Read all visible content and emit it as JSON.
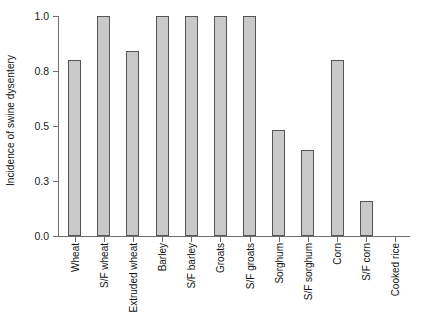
{
  "chart_data": {
    "type": "bar",
    "title": "",
    "xlabel": "",
    "ylabel": "Incidence of swine dysentery",
    "categories": [
      "Wheat",
      "S/F wheat",
      "Extruded wheat",
      "Barley",
      "S/F barley",
      "Groats",
      "S/F groats",
      "Sorghum",
      "S/F sorghum",
      "Corn",
      "S/F corn",
      "Cooked rice"
    ],
    "values": [
      0.8,
      1.0,
      0.84,
      1.0,
      1.0,
      1.0,
      1.0,
      0.48,
      0.39,
      0.8,
      0.16,
      0.0
    ],
    "ylim": [
      0.0,
      1.0
    ],
    "ytick_values": [
      0.0,
      0.3,
      0.5,
      0.8,
      1.0
    ],
    "ytick_labels": [
      "0.0",
      "0.3",
      "0.5",
      "0.8",
      "1.0"
    ],
    "ytick_positions": [
      0.0,
      0.25,
      0.5,
      0.75,
      1.0
    ],
    "grid": false,
    "legend": null,
    "bar_fill_color": "#c9c9c9",
    "bar_edge_color": "#555555",
    "axis_color": "#6e6e6e"
  }
}
